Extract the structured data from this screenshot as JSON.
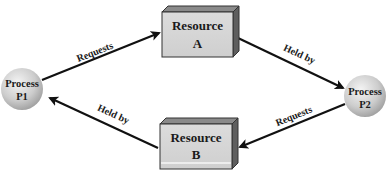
{
  "diagram": {
    "type": "resource-allocation-deadlock",
    "nodes": [
      {
        "id": "p1",
        "kind": "process",
        "line1": "Process",
        "line2": "P1"
      },
      {
        "id": "p2",
        "kind": "process",
        "line1": "Process",
        "line2": "P2"
      },
      {
        "id": "ra",
        "kind": "resource",
        "line1": "Resource",
        "line2": "A"
      },
      {
        "id": "rb",
        "kind": "resource",
        "line1": "Resource",
        "line2": "B"
      }
    ],
    "edges": [
      {
        "from": "p1",
        "to": "ra",
        "label": "Requests"
      },
      {
        "from": "ra",
        "to": "p2",
        "label": "Held by"
      },
      {
        "from": "p2",
        "to": "rb",
        "label": "Requests"
      },
      {
        "from": "rb",
        "to": "p1",
        "label": "Held by"
      }
    ]
  },
  "colors": {
    "box_front": "#d6d6d6",
    "box_top": "#8a8a8a",
    "box_side": "#5e5e5e",
    "arrow": "#111111",
    "circle_light": "#f2f2f2",
    "circle_dark": "#a8a8a8"
  }
}
